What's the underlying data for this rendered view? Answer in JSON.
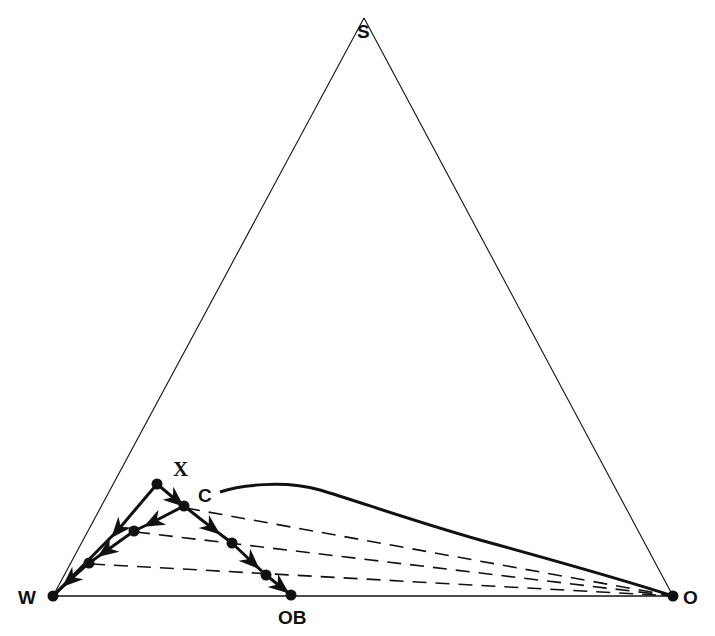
{
  "diagram": {
    "type": "ternary-phase-diagram",
    "vertices": {
      "top": {
        "label": "S",
        "x": 364,
        "y": 18
      },
      "left": {
        "label": "W",
        "x": 53,
        "y": 596
      },
      "right": {
        "label": "O",
        "x": 673,
        "y": 596
      }
    },
    "points": {
      "X": {
        "label": "X",
        "x": 157,
        "y": 484
      },
      "C": {
        "label": "C",
        "x": 184,
        "y": 506
      },
      "OB": {
        "label": "OB",
        "x": 291,
        "y": 595
      },
      "r1": {
        "x": 134,
        "y": 531
      },
      "r2": {
        "x": 89,
        "y": 563
      },
      "e1": {
        "x": 232,
        "y": 543
      },
      "e2": {
        "x": 266,
        "y": 575
      }
    },
    "paths": [
      {
        "name": "X-to-W",
        "from": "X",
        "to": "W",
        "style": "solid-arrow"
      },
      {
        "name": "X-to-C",
        "from": "X",
        "to": "C",
        "style": "solid-arrow"
      },
      {
        "name": "C-to-W",
        "from": "C",
        "to": "W",
        "style": "solid-arrow",
        "through": [
          "r1",
          "r2"
        ]
      },
      {
        "name": "C-to-OB",
        "from": "C",
        "to": "OB",
        "style": "solid-arrow",
        "through": [
          "e1",
          "e2"
        ]
      }
    ],
    "tie_lines": [
      {
        "from": "C",
        "to": "O"
      },
      {
        "from": "r1",
        "to": "O"
      },
      {
        "from": "r2",
        "to": "O"
      }
    ],
    "binodal_curve": {
      "from": "C",
      "to": "O",
      "style": "solid-bold"
    },
    "colors": {
      "line": "#111111",
      "background": "#ffffff"
    }
  }
}
